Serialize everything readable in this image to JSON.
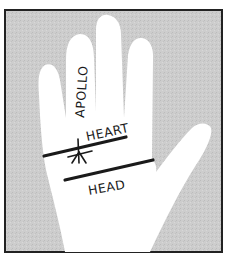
{
  "diagram": {
    "type": "palmistry-hand-illustration",
    "labels": {
      "finger": "APOLLO",
      "upper_line": "HEART",
      "lower_line": "HEAD"
    },
    "marks": [
      {
        "name": "star",
        "on": "HEART"
      }
    ],
    "colors": {
      "background": "#cfcfcf",
      "hand": "#ffffff",
      "lines": "#1a1a1a",
      "frame": "#222222"
    }
  }
}
